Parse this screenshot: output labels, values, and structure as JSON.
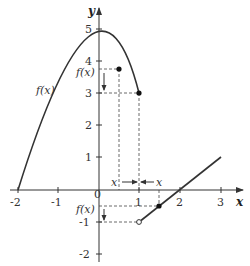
{
  "diagram": {
    "type": "function-graph",
    "axes": {
      "x_label": "x",
      "y_label": "y",
      "x_ticks": [
        "-2",
        "-1",
        "1",
        "2",
        "3"
      ],
      "y_ticks": [
        "5",
        "4",
        "3",
        "2",
        "1",
        "-1",
        "-2"
      ],
      "origin_label": "0"
    },
    "pieces": [
      {
        "formula": "4 - x^2",
        "domain": "-2 <= x <= 1",
        "endpoint": "closed at (1,3)"
      },
      {
        "formula": "x - 2",
        "domain": "1 < x <= 3",
        "endpoint": "open at (1,-1)"
      }
    ],
    "labels": {
      "curve_label": "f(x)",
      "upper_fx": "f(x)",
      "lower_fx": "f(x)",
      "left_x": "x",
      "right_x": "x"
    },
    "points": [
      {
        "x": 0.5,
        "y": 3.75,
        "style": "filled"
      },
      {
        "x": 1,
        "y": 3,
        "style": "filled"
      },
      {
        "x": 1.5,
        "y": -0.5,
        "style": "filled"
      },
      {
        "x": 1,
        "y": -1,
        "style": "open"
      }
    ],
    "colors": {
      "ink": "#333333",
      "background": "#ffffff"
    }
  }
}
